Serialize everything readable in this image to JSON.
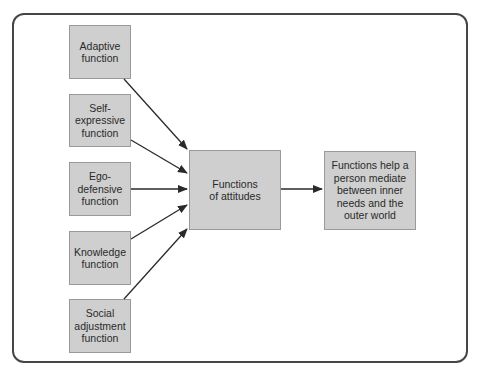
{
  "diagram": {
    "inputs": [
      {
        "id": "adaptive",
        "label": "Adaptive\nfunction"
      },
      {
        "id": "self-expressive",
        "label": "Self-\nexpressive\nfunction"
      },
      {
        "id": "ego-defensive",
        "label": "Ego-\ndefensive\nfunction"
      },
      {
        "id": "knowledge",
        "label": "Knowledge\nfunction"
      },
      {
        "id": "social-adjustment",
        "label": "Social\nadjustment\nfunction"
      }
    ],
    "center": {
      "label": "Functions\nof attitudes"
    },
    "outcome": {
      "label": "Functions help a\nperson mediate\nbetween inner\nneeds and the\nouter world"
    },
    "colors": {
      "box_fill": "#cfcfcf",
      "box_border": "#9a9a9a",
      "arrow": "#2a2a2a",
      "frame": "#464646"
    }
  }
}
